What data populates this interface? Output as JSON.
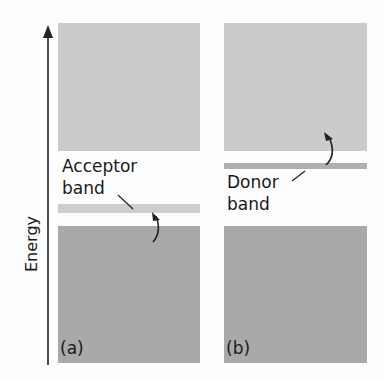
{
  "axis": {
    "label": "Energy"
  },
  "panels": [
    {
      "id": "a",
      "tag": "(a)",
      "band_label_line1": "Acceptor",
      "band_label_line2": "band"
    },
    {
      "id": "b",
      "tag": "(b)",
      "band_label_line1": "Donor",
      "band_label_line2": "band"
    }
  ],
  "colors": {
    "conduction_band": "#cbcbcb",
    "valence_band": "#a9a9a9",
    "acceptor_band": "#cdcdcd",
    "donor_band": "#b0b0b0"
  }
}
